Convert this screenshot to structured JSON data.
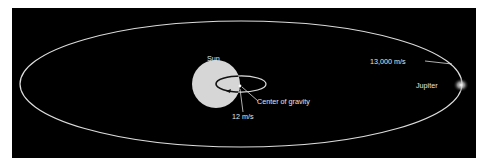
{
  "diagram": {
    "labels": {
      "sun": "Sun",
      "center_of_gravity": "Center of gravity",
      "sun_velocity": "12 m/s",
      "jupiter_velocity": "13,000 m/s",
      "jupiter": "Jupiter"
    },
    "colors": {
      "background": "#000000",
      "orbit": "#dcdcdc",
      "sun": "#d6d6d6",
      "sun_orbit": "#111111",
      "text": "#e6e6e6"
    }
  }
}
